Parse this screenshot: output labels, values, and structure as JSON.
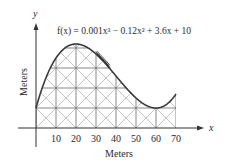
{
  "chart_data": {
    "type": "line",
    "title": "f(x) = 0.001x³ − 0.12x² + 3.6x + 10",
    "function": {
      "a3": 0.001,
      "a2": -0.12,
      "a1": 3.6,
      "a0": 10
    },
    "xlabel": "Meters",
    "ylabel": "Meters",
    "x_axis_symbol": "x",
    "y_axis_symbol": "y",
    "x_ticks": [
      10,
      20,
      30,
      40,
      50,
      60,
      70
    ],
    "x_tick_labels": [
      "10",
      "20",
      "30",
      "40",
      "50",
      "60",
      "70"
    ],
    "xlim": [
      0,
      70
    ],
    "ylim": [
      0,
      42
    ],
    "grid_horizontal_at": [
      10,
      20,
      30,
      40
    ],
    "grid_vertical_at": [
      10,
      20,
      30,
      40,
      50,
      60,
      70
    ],
    "x": [
      0,
      10,
      20,
      30,
      40,
      50,
      60,
      70
    ],
    "y": [
      10,
      35,
      42,
      37,
      26,
      15,
      10,
      17
    ],
    "annotations": [
      "roller coaster car on track near x≈30–37"
    ],
    "colors": {
      "line": "#3a3a3a",
      "lattice": "#555555",
      "text": "#2a2a2a"
    }
  },
  "labels": {
    "equation": "f(x) = 0.001x³ − 0.12x² + 3.6x + 10",
    "x_axis_title": "Meters",
    "y_axis_title": "Meters",
    "x_symbol": "x",
    "y_symbol": "y"
  }
}
